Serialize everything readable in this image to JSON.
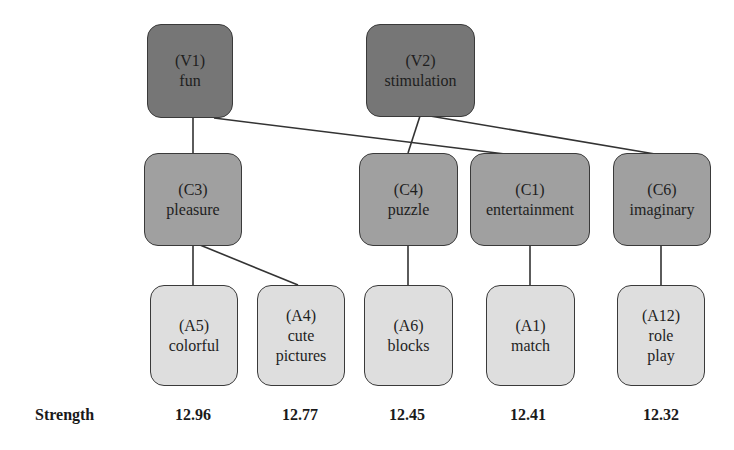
{
  "diagram": {
    "type": "means-end hierarchical value map",
    "levels": [
      "value",
      "consequence",
      "attribute"
    ],
    "colors": {
      "value_fill": "#767676",
      "consequence_fill": "#a0a0a0",
      "attribute_fill": "#dedede",
      "border": "#3a3a3a",
      "line": "#333333"
    },
    "nodes": {
      "V1": {
        "code": "(V1)",
        "lines": [
          "fun"
        ]
      },
      "V2": {
        "code": "(V2)",
        "lines": [
          "stimulation"
        ]
      },
      "C3": {
        "code": "(C3)",
        "lines": [
          "pleasure"
        ]
      },
      "C4": {
        "code": "(C4)",
        "lines": [
          "puzzle"
        ]
      },
      "C1": {
        "code": "(C1)",
        "lines": [
          "entertainment"
        ]
      },
      "C6": {
        "code": "(C6)",
        "lines": [
          "imaginary"
        ]
      },
      "A5": {
        "code": "(A5)",
        "lines": [
          "colorful"
        ]
      },
      "A4": {
        "code": "(A4)",
        "lines": [
          "cute",
          "pictures"
        ]
      },
      "A6": {
        "code": "(A6)",
        "lines": [
          "blocks"
        ]
      },
      "A1": {
        "code": "(A1)",
        "lines": [
          "match"
        ]
      },
      "A12": {
        "code": "(A12)",
        "lines": [
          "role",
          "play"
        ]
      }
    },
    "edges": [
      {
        "from": "V1",
        "to": "C3"
      },
      {
        "from": "V1",
        "to": "C1"
      },
      {
        "from": "V2",
        "to": "C4"
      },
      {
        "from": "V2",
        "to": "C6"
      },
      {
        "from": "C3",
        "to": "A5"
      },
      {
        "from": "C3",
        "to": "A4"
      },
      {
        "from": "C4",
        "to": "A6"
      },
      {
        "from": "C1",
        "to": "A1"
      },
      {
        "from": "C6",
        "to": "A12"
      }
    ]
  },
  "strength": {
    "label": "Strength",
    "values": [
      "12.96",
      "12.77",
      "12.45",
      "12.41",
      "12.32"
    ]
  }
}
